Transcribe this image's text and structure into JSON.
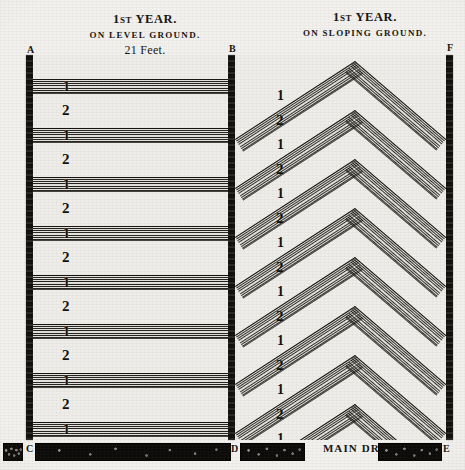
{
  "figure": {
    "background_color": "#f2f1ee",
    "ink_color": "#15130e"
  },
  "panels": [
    {
      "id": "level-ground",
      "title_ordinal": "1",
      "title_ordinal_suffix": "ST",
      "title_word": " YEAR.",
      "subtitle": "ON LEVEL GROUND.",
      "measurement": "21 Feet.",
      "drain_shape": "horizontal",
      "left_letter": "A",
      "right_letter": "B",
      "bottom_left_letter": "C",
      "bottom_right_letter": "D",
      "drain_label": "1",
      "gap_label": "2",
      "drain_count": 8,
      "gap_count": 7
    },
    {
      "id": "sloping-ground",
      "title_ordinal": "1",
      "title_ordinal_suffix": "ST",
      "title_word": " YEAR.",
      "subtitle": "ON SLOPING GROUND.",
      "measurement": "",
      "drain_shape": "chevron",
      "left_letter": "B",
      "right_letter": "F",
      "bottom_left_letter": "D",
      "bottom_right_letter": "E",
      "drain_label": "1",
      "gap_label": "2",
      "drain_count": 8,
      "gap_count": 7
    }
  ],
  "main_drain": {
    "label": "MAIN DRAIN.",
    "left_letter": "C",
    "middle_letter": "D",
    "right_letter": "E"
  },
  "chart_data": {
    "type": "diagram",
    "left_panel": {
      "name": "ON LEVEL GROUND.",
      "spacing_note": "21 Feet.",
      "sequence": [
        "1",
        "2",
        "1",
        "2",
        "1",
        "2",
        "1",
        "2",
        "1",
        "2",
        "1",
        "2",
        "1",
        "2",
        "1"
      ]
    },
    "right_panel": {
      "name": "ON SLOPING GROUND.",
      "spacing_note": "",
      "sequence": [
        "1",
        "2",
        "1",
        "2",
        "1",
        "2",
        "1",
        "2",
        "1",
        "2",
        "1",
        "2",
        "1",
        "2",
        "1"
      ]
    },
    "corner_labels": [
      "A",
      "B",
      "F",
      "C",
      "D",
      "E"
    ],
    "footer": "MAIN DRAIN."
  }
}
